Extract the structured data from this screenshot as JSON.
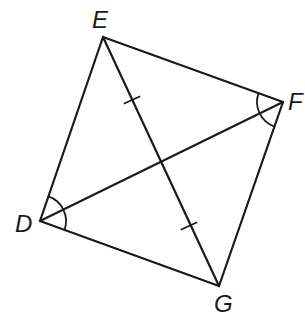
{
  "diagram": {
    "type": "quadrilateral-with-diagonals",
    "stroke_color": "#1a1a1a",
    "background": "#ffffff",
    "vertices": {
      "E": {
        "label": "E",
        "x": 103,
        "y": 37,
        "label_x": 92,
        "label_y": 8
      },
      "F": {
        "label": "F",
        "x": 283,
        "y": 102,
        "label_x": 288,
        "label_y": 90
      },
      "D": {
        "label": "D",
        "x": 40,
        "y": 221,
        "label_x": 15,
        "label_y": 212
      },
      "G": {
        "label": "G",
        "x": 219,
        "y": 286,
        "label_x": 214,
        "label_y": 292
      }
    },
    "sides": [
      [
        "E",
        "F"
      ],
      [
        "F",
        "G"
      ],
      [
        "G",
        "D"
      ],
      [
        "D",
        "E"
      ]
    ],
    "diagonals": [
      [
        "E",
        "G"
      ],
      [
        "D",
        "F"
      ]
    ],
    "congruent_segment_marks": [
      {
        "segment": "EO",
        "tick_at": [
          132,
          100
        ]
      },
      {
        "segment": "OG",
        "tick_at": [
          189,
          226
        ]
      }
    ],
    "congruent_angle_marks": [
      {
        "vertex": "D",
        "radius": 26
      },
      {
        "vertex": "F",
        "radius": 26
      }
    ]
  }
}
